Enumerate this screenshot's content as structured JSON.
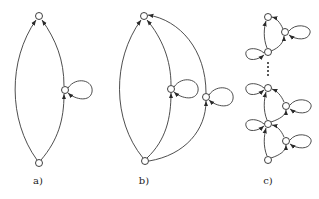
{
  "figure": {
    "panels": [
      {
        "id": "a",
        "label": "a)"
      },
      {
        "id": "b",
        "label": "b)"
      },
      {
        "id": "c",
        "label": "c)"
      }
    ],
    "colors": {
      "stroke": "#3a3a3a",
      "node_fill": "#ffffff",
      "background": "#ffffff"
    }
  }
}
